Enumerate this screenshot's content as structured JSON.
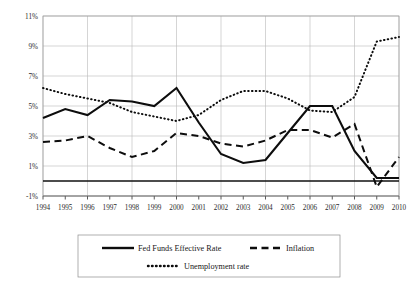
{
  "chart_data": {
    "type": "line",
    "title": "",
    "xlabel": "",
    "ylabel": "",
    "grid": true,
    "legend_position": "bottom",
    "xlim": [
      1994,
      2010
    ],
    "ylim": [
      -1,
      11
    ],
    "categories": [
      1994,
      1995,
      1996,
      1997,
      1998,
      1999,
      2000,
      2001,
      2002,
      2003,
      2004,
      2005,
      2006,
      2007,
      2008,
      2009,
      2010
    ],
    "x_tick_labels": [
      "1994",
      "1995",
      "1996",
      "1997",
      "1998",
      "1999",
      "2000",
      "2001",
      "2002",
      "2003",
      "2004",
      "2005",
      "2006",
      "2007",
      "2008",
      "2009",
      "2010"
    ],
    "y_tick_labels": [
      "11%",
      "9%",
      "7%",
      "5%",
      "3%",
      "1%",
      "-1%"
    ],
    "y_tick_values": [
      11,
      9,
      7,
      5,
      3,
      1,
      -1
    ],
    "series": [
      {
        "name": "Fed Funds Effective Rate",
        "style": "solid",
        "values": [
          4.2,
          4.8,
          4.4,
          5.4,
          5.3,
          5.0,
          6.2,
          3.9,
          1.8,
          1.2,
          1.4,
          3.2,
          5.0,
          5.0,
          2.0,
          0.2,
          0.2
        ]
      },
      {
        "name": "Inflation",
        "style": "dashed",
        "values": [
          2.6,
          2.7,
          3.0,
          2.2,
          1.6,
          2.0,
          3.2,
          3.0,
          2.5,
          2.3,
          2.7,
          3.4,
          3.4,
          2.9,
          3.8,
          -0.4,
          1.6
        ]
      },
      {
        "name": "Unemployment rate",
        "style": "dotted",
        "values": [
          6.2,
          5.8,
          5.5,
          5.2,
          4.6,
          4.3,
          4.0,
          4.4,
          5.4,
          6.0,
          6.0,
          5.5,
          4.7,
          4.6,
          5.6,
          9.3,
          9.6
        ]
      }
    ]
  },
  "legend": {
    "items": [
      {
        "label": "Fed Funds Effective Rate",
        "style": "solid"
      },
      {
        "label": "Inflation",
        "style": "dashed"
      },
      {
        "label": "Unemployment rate",
        "style": "dotted"
      }
    ]
  },
  "colors": {
    "series_stroke": "#0d0d0d",
    "gridline": "#b9b9b9",
    "axis": "#111111",
    "background": "#ffffff",
    "text": "#1a1a1a"
  }
}
